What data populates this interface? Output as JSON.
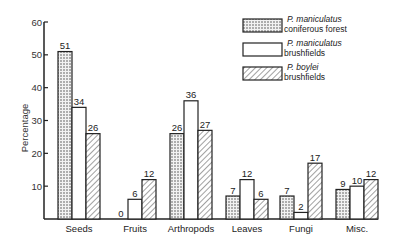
{
  "chart_data": {
    "type": "bar",
    "title": "",
    "xlabel": "",
    "ylabel": "Percentage",
    "ylim": [
      0,
      60
    ],
    "yticks": [
      10,
      20,
      30,
      40,
      50,
      60
    ],
    "grid": false,
    "legend_position": "top-right",
    "categories": [
      "Seeds",
      "Fruits",
      "Arthropods",
      "Leaves",
      "Fungi",
      "Misc."
    ],
    "series": [
      {
        "name": "P. maniculatus coniferous forest",
        "name_italic": "P. maniculatus",
        "name_plain": "coniferous forest",
        "pattern": "dots",
        "values": [
          51,
          0,
          26,
          7,
          7,
          9
        ]
      },
      {
        "name": "P. maniculatus brushfields",
        "name_italic": "P. maniculatus",
        "name_plain": "brushfields",
        "pattern": "blank",
        "values": [
          34,
          6,
          36,
          12,
          2,
          10
        ]
      },
      {
        "name": "P. boylei brushfields",
        "name_italic": "P. boylei",
        "name_plain": "brushfields",
        "pattern": "hatch",
        "values": [
          26,
          12,
          27,
          6,
          17,
          12
        ]
      }
    ]
  },
  "colors": {
    "ink": "#222222",
    "background": "#ffffff"
  }
}
